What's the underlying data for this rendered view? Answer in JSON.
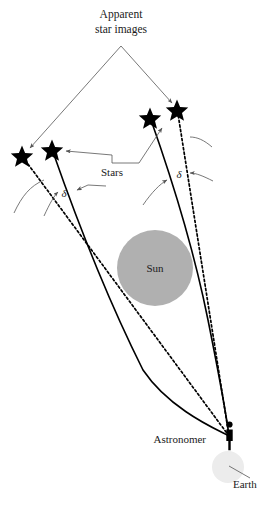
{
  "figure": {
    "labels": {
      "apparent_line1": "Apparent",
      "apparent_line2": "star images",
      "stars": "Stars",
      "sun": "Sun",
      "astronomer": "Astronomer",
      "earth": "Earth",
      "delta_left": "δ",
      "delta_right": "δ"
    },
    "colors": {
      "background": "#ffffff",
      "sun_fill": "#b0b0b0",
      "earth_fill": "#ececec",
      "star_fill": "#000000",
      "ray_stroke": "#000000",
      "pointer_stroke": "#555555",
      "text": "#1a1a1a"
    },
    "objects": {
      "sun": {
        "cx": 155,
        "cy": 268,
        "r": 38
      },
      "earth": {
        "cx": 228,
        "cy": 467,
        "r": 16
      },
      "observer": {
        "x": 229,
        "y": 436
      },
      "stars": [
        {
          "name": "apparent-star-left",
          "x": 22,
          "y": 156,
          "kind": "apparent"
        },
        {
          "name": "true-star-left",
          "x": 52,
          "y": 150,
          "kind": "true"
        },
        {
          "name": "true-star-right",
          "x": 150,
          "y": 118,
          "kind": "true"
        },
        {
          "name": "apparent-star-right",
          "x": 177,
          "y": 110,
          "kind": "apparent"
        }
      ]
    },
    "label_positions": {
      "apparent_line1": {
        "x": 121,
        "y": 18
      },
      "apparent_line2": {
        "x": 121,
        "y": 33
      },
      "stars": {
        "x": 112,
        "y": 175
      },
      "sun": {
        "x": 155,
        "y": 272
      },
      "astronomer": {
        "x": 208,
        "y": 442
      },
      "earth": {
        "x": 232,
        "y": 484
      },
      "delta_left": {
        "x": 64,
        "y": 196
      },
      "delta_right": {
        "x": 179,
        "y": 177
      }
    }
  }
}
